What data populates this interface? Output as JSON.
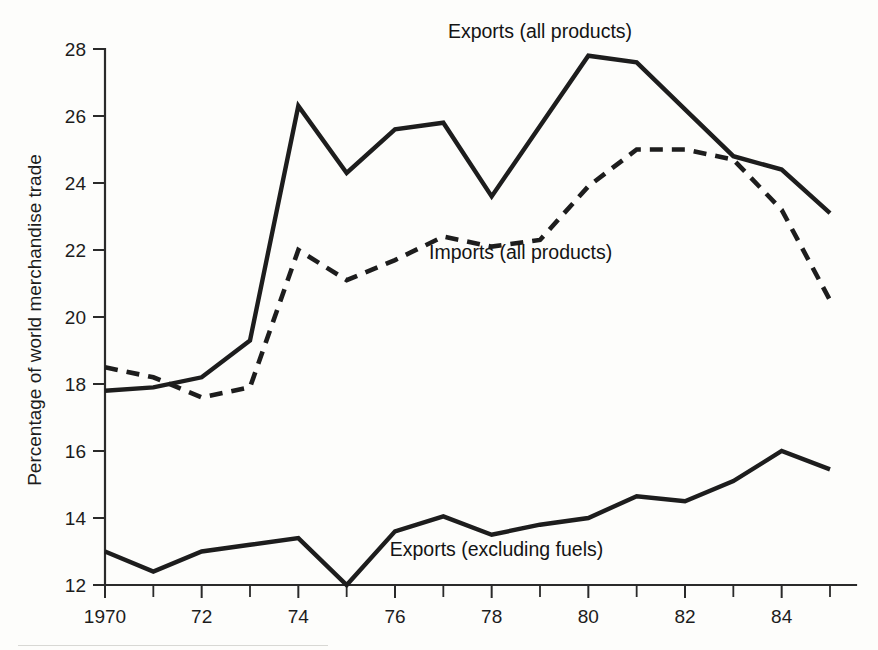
{
  "chart_data": {
    "type": "line",
    "title": "",
    "xlabel": "",
    "ylabel": "Percentage of world merchandise trade",
    "xlim": [
      1970,
      1985
    ],
    "ylim": [
      12,
      28
    ],
    "grid": false,
    "legend_position": "inline-annotations",
    "x": [
      1970,
      1971,
      1972,
      1973,
      1974,
      1975,
      1976,
      1977,
      1978,
      1979,
      1980,
      1981,
      1982,
      1983,
      1984,
      1985
    ],
    "x_tick_labels": [
      "1970",
      "72",
      "74",
      "76",
      "78",
      "80",
      "82",
      "84"
    ],
    "x_major_ticks": [
      1970,
      1972,
      1974,
      1976,
      1978,
      1980,
      1982,
      1984
    ],
    "x_minor_ticks": [
      1971,
      1973,
      1975,
      1977,
      1979,
      1981,
      1983,
      1985
    ],
    "y_tick_labels": [
      "12",
      "14",
      "16",
      "18",
      "20",
      "22",
      "24",
      "26",
      "28"
    ],
    "y_ticks": [
      12,
      14,
      16,
      18,
      20,
      22,
      24,
      26,
      28
    ],
    "series": [
      {
        "name": "Exports (all products)",
        "style": "solid",
        "label_x": 1979.0,
        "label_y": 28.5,
        "values": [
          17.8,
          17.9,
          18.2,
          19.3,
          26.3,
          24.3,
          25.6,
          25.8,
          23.6,
          25.7,
          27.8,
          27.6,
          26.2,
          24.8,
          24.4,
          23.1
        ]
      },
      {
        "name": "Imports (all products)",
        "style": "dashed",
        "label_x": 1978.6,
        "label_y": 21.9,
        "values": [
          18.5,
          18.2,
          17.6,
          17.9,
          22.0,
          21.1,
          21.7,
          22.4,
          22.1,
          22.3,
          23.9,
          25.0,
          25.0,
          24.7,
          23.2,
          20.5
        ]
      },
      {
        "name": "Exports (excluding fuels)",
        "style": "solid",
        "label_x": 1978.1,
        "label_y": 13.05,
        "values": [
          13.0,
          12.4,
          13.0,
          13.2,
          13.4,
          12.0,
          13.6,
          14.05,
          13.5,
          13.8,
          14.0,
          14.65,
          14.5,
          15.1,
          16.0,
          15.45
        ]
      }
    ]
  }
}
